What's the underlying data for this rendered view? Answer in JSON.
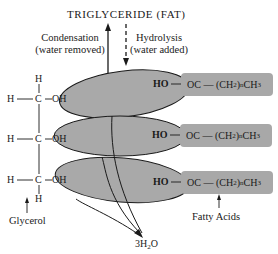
{
  "title": "TRIGLYCERIDE (FAT)",
  "condensation": {
    "line1": "Condensation",
    "line2": "(water removed)"
  },
  "hydrolysis": {
    "line1": "Hydrolysis",
    "line2": "(water added)"
  },
  "glycerol": {
    "label": "Glycerol",
    "top_h": "H",
    "bottom_h": "H",
    "rows": [
      {
        "h": "H",
        "c": "C",
        "oh": "OH"
      },
      {
        "h": "H",
        "c": "C",
        "oh": "OH"
      },
      {
        "h": "H",
        "c": "C",
        "oh": "OH"
      }
    ]
  },
  "fatty_acids": {
    "label": "Fatty Acids",
    "rows": [
      {
        "ho": "HO",
        "oc": "OC",
        "chain": "(CH",
        "sub2": "2",
        "paren": ")",
        "subn": "n",
        "ch": "CH",
        "sub3": "3"
      },
      {
        "ho": "HO",
        "oc": "OC",
        "chain": "(CH",
        "sub2": "2",
        "paren": ")",
        "subn": "n",
        "ch": "CH",
        "sub3": "3"
      },
      {
        "ho": "HO",
        "oc": "OC",
        "chain": "(CH",
        "sub2": "2",
        "paren": ")",
        "subn": "n",
        "ch": "CH",
        "sub3": "3"
      }
    ]
  },
  "water": {
    "coef": "3",
    "h": "H",
    "sub": "2",
    "o": "O"
  },
  "colors": {
    "oval_fill": "#a9a9a9",
    "box_fill": "#a8a8a8",
    "stroke": "#1a1a1a"
  }
}
